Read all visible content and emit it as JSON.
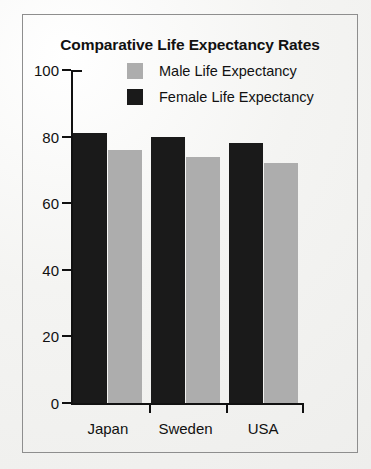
{
  "chart_data": {
    "type": "bar",
    "title": "Comparative Life Expectancy Rates",
    "xlabel": "",
    "ylabel": "",
    "categories": [
      "Japan",
      "Sweden",
      "USA"
    ],
    "series": [
      {
        "name": "Female Life Expectancy",
        "color": "#1a1a1a",
        "values": [
          81,
          80,
          78
        ]
      },
      {
        "name": "Male Life Expectancy",
        "color": "#adadad",
        "values": [
          76,
          74,
          72
        ]
      }
    ],
    "series_draw_order": [
      "Female Life Expectancy",
      "Male Life Expectancy"
    ],
    "ylim": [
      0,
      100
    ],
    "y_ticks": [
      0,
      20,
      40,
      60,
      80,
      100
    ],
    "y_tick_labels": [
      "0",
      "20",
      "40",
      "60",
      "80",
      "100"
    ],
    "grid": false,
    "legend": {
      "position": "inside-top-center",
      "entries": [
        {
          "label": "Male Life Expectancy",
          "color": "#adadad"
        },
        {
          "label": "Female Life Expectancy",
          "color": "#1a1a1a"
        }
      ]
    },
    "frame": {
      "border_color": "#8e8e8e",
      "background": "#f2f2f0"
    }
  }
}
